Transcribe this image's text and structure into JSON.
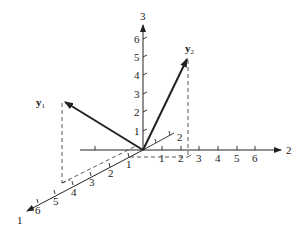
{
  "figure": {
    "type": "3d-vector-diagram",
    "origin_px": [
      143,
      150
    ],
    "unit_px": {
      "axis1": [
        -18.3,
        9.4
      ],
      "axis2": [
        18.7,
        0
      ],
      "axis3": [
        0,
        -18.5
      ]
    },
    "colors": {
      "ink": "#222222",
      "dash": "#444444",
      "background": "#ffffff"
    }
  },
  "axes": [
    {
      "id": "axis1",
      "label": "1",
      "ticks": [
        "1",
        "2",
        "3",
        "4",
        "5",
        "6"
      ]
    },
    {
      "id": "axis2",
      "label": "2",
      "ticks": [
        "1",
        "2",
        "3",
        "4",
        "5",
        "6"
      ]
    },
    {
      "id": "axis3",
      "label": "3",
      "ticks": [
        "1",
        "2",
        "3",
        "4",
        "5",
        "6"
      ]
    }
  ],
  "negative_axis": {
    "axis1_back_label": "2"
  },
  "vectors": [
    {
      "id": "y1",
      "name": "y",
      "subscript": "1",
      "components": [
        4,
        -3,
        2
      ]
    },
    {
      "id": "y2",
      "name": "y",
      "subscript": "2",
      "components": [
        -2,
        2.4,
        5
      ]
    }
  ],
  "dashed_labels": {
    "one": "1",
    "two": "2",
    "three": "3"
  }
}
